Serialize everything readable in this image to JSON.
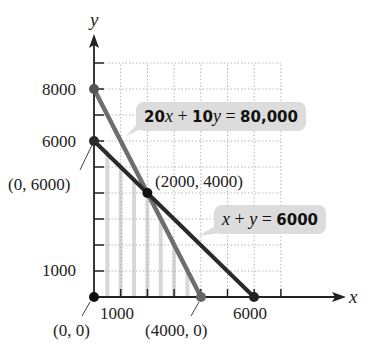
{
  "chart_data": {
    "type": "line",
    "title": "",
    "xlabel": "x",
    "ylabel": "y",
    "xlim": [
      0,
      8000
    ],
    "ylim": [
      0,
      9000
    ],
    "grid": true,
    "grid_style": "dotted",
    "x_ticks": [
      0,
      1000,
      2000,
      3000,
      4000,
      5000,
      6000,
      7000
    ],
    "y_ticks": [
      0,
      1000,
      2000,
      3000,
      4000,
      5000,
      6000,
      7000,
      8000,
      9000
    ],
    "x_tick_labels": [
      "1000",
      "6000"
    ],
    "y_tick_labels": [
      "1000",
      "6000",
      "8000"
    ],
    "series": [
      {
        "name": "20x + 10y = 80,000",
        "color": "#6e6e6e",
        "points": [
          [
            0,
            8000
          ],
          [
            4000,
            0
          ]
        ]
      },
      {
        "name": "x + y = 6000",
        "color": "#2a2a2a",
        "points": [
          [
            0,
            6000
          ],
          [
            6000,
            0
          ]
        ]
      }
    ],
    "feasible_region": {
      "vertices": [
        [
          0,
          0
        ],
        [
          0,
          6000
        ],
        [
          2000,
          4000
        ],
        [
          4000,
          0
        ]
      ],
      "fill": "vertical light gray stripes"
    },
    "annotations": [
      {
        "text": "(0, 6000)",
        "point": [
          0,
          6000
        ]
      },
      {
        "text": "(2000, 4000)",
        "point": [
          2000,
          4000
        ]
      },
      {
        "text": "(0, 0)",
        "point": [
          0,
          0
        ]
      },
      {
        "text": "(4000, 0)",
        "point": [
          4000,
          0
        ]
      }
    ],
    "marked_points": [
      [
        0,
        0
      ],
      [
        0,
        6000
      ],
      [
        0,
        8000
      ],
      [
        2000,
        4000
      ],
      [
        4000,
        0
      ],
      [
        6000,
        0
      ]
    ]
  },
  "labels": {
    "x_axis": "x",
    "y_axis": "y",
    "y8000": "8000",
    "y6000": "6000",
    "y1000": "1000",
    "x1000": "1000",
    "x6000": "6000",
    "pt_0_6000": "(0, 6000)",
    "pt_2000_4000": "(2000, 4000)",
    "pt_0_0": "(0, 0)",
    "pt_4000_0": "(4000, 0)"
  },
  "equations": {
    "eq1": {
      "coef1": "20",
      "var1": "x",
      "plus": " + ",
      "coef2": "10",
      "var2": "y",
      "eq": " = ",
      "rhs": "80,000"
    },
    "eq2": {
      "var1": "x",
      "plus": " + ",
      "var2": "y",
      "eq": " = ",
      "rhs": "6000"
    }
  },
  "colors": {
    "line1": "#6e6e6e",
    "line2": "#2a2a2a",
    "bubble": "#dcdcdc",
    "stripe": "#d8d8d8",
    "grid": "#b5b5b5"
  }
}
